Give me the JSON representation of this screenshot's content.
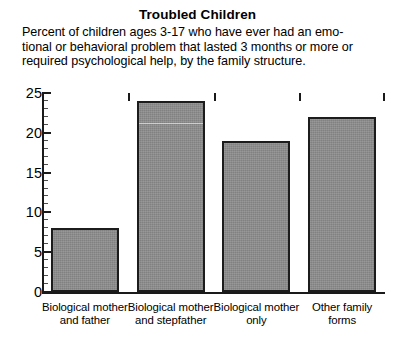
{
  "chart_data": {
    "type": "bar",
    "title": "Troubled Children",
    "subtitle_lines": [
      "Percent of children ages 3-17 who have ever had an emo-",
      "tional or behavioral problem that lasted 3 months or more or",
      "required psychological help, by the family structure."
    ],
    "categories": [
      "Biological mother and father",
      "Biological mother and stepfather",
      "Biological mother only",
      "Other family forms"
    ],
    "category_lines": [
      [
        "Biological mother",
        "and father"
      ],
      [
        "Biological mother",
        "and stepfather"
      ],
      [
        "Biological mother",
        "only"
      ],
      [
        "Other family",
        "forms"
      ]
    ],
    "values": [
      8,
      24,
      19,
      22
    ],
    "xlabel": "",
    "ylabel": "",
    "ylim": [
      0,
      25
    ],
    "ytick_labels": [
      "0",
      "5",
      "10",
      "15",
      "20",
      "25"
    ],
    "ytick_values": [
      0,
      5,
      10,
      15,
      20,
      25
    ],
    "yminor_step": 1,
    "grid": false,
    "legend": null,
    "colors": {
      "bar_fill": "#8c8c8c",
      "bar_edge": "#1c1c1c",
      "axis": "#1a1a1a",
      "text": "#000000",
      "background": "#ffffff"
    }
  }
}
